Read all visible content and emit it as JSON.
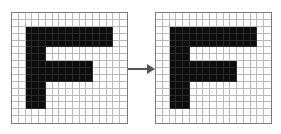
{
  "diagram": {
    "grid": {
      "cols": 17,
      "rows": 16,
      "filled_color": "#0d0d0d",
      "empty_color": "#ffffff",
      "line_color": "#b9b9b9",
      "border_color": "#7a7a7a"
    },
    "shape_letter": "F",
    "filled_regions": [
      {
        "name": "stem",
        "col_start": 2,
        "col_end": 4,
        "row_start": 2,
        "row_end": 13
      },
      {
        "name": "top-bar",
        "col_start": 2,
        "col_end": 14,
        "row_start": 2,
        "row_end": 4
      },
      {
        "name": "middle-bar",
        "col_start": 2,
        "col_end": 11,
        "row_start": 7,
        "row_end": 9
      }
    ],
    "panels": [
      {
        "id": "input",
        "x": 11,
        "y": 12,
        "width": 117,
        "height": 112
      },
      {
        "id": "output",
        "x": 155,
        "y": 12,
        "width": 117,
        "height": 112
      }
    ],
    "arrow": {
      "from_x": 128,
      "to_x": 154,
      "y": 68,
      "color": "#555555",
      "direction": "right"
    }
  }
}
